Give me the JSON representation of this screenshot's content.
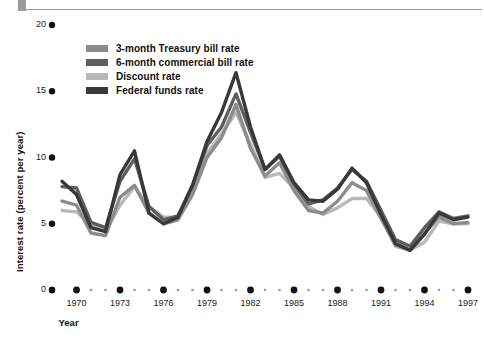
{
  "figure": {
    "rule_color": "#9a9a9a"
  },
  "axes": {
    "y_title": "Interest rate (percent per year)",
    "x_title": "Year",
    "y_ticks": [
      "0",
      "5",
      "10",
      "15",
      "20"
    ],
    "y_tick_values": [
      0,
      5,
      10,
      15,
      20
    ],
    "x_ticks": [
      "1970",
      "1973",
      "1976",
      "1979",
      "1982",
      "1985",
      "1988",
      "1991",
      "1994",
      "1997"
    ],
    "x_tick_values": [
      1970,
      1973,
      1976,
      1979,
      1982,
      1985,
      1988,
      1991,
      1994,
      1997
    ]
  },
  "legend": [
    {
      "label": "3-month Treasury bill rate",
      "color": "#8c8c8c"
    },
    {
      "label": "6-month commercial bill rate",
      "color": "#5e5e5e"
    },
    {
      "label": "Discount rate",
      "color": "#b9b9b9"
    },
    {
      "label": "Federal funds rate",
      "color": "#383838"
    }
  ],
  "chart_data": {
    "type": "line",
    "title": "",
    "xlabel": "Year",
    "ylabel": "Interest rate (percent per year)",
    "xlim": [
      1969,
      1997
    ],
    "ylim": [
      0,
      20
    ],
    "grid": false,
    "legend_position": "top-left-inside",
    "x": [
      1969,
      1970,
      1971,
      1972,
      1973,
      1974,
      1975,
      1976,
      1977,
      1978,
      1979,
      1980,
      1981,
      1982,
      1983,
      1984,
      1985,
      1986,
      1987,
      1988,
      1989,
      1990,
      1991,
      1992,
      1993,
      1994,
      1995,
      1996,
      1997
    ],
    "series": [
      {
        "name": "3-month Treasury bill rate",
        "color": "#8c8c8c",
        "values": [
          6.7,
          6.4,
          4.3,
          4.1,
          7.0,
          7.9,
          5.8,
          5.0,
          5.3,
          7.2,
          10.0,
          11.5,
          14.0,
          10.7,
          8.6,
          9.6,
          7.5,
          6.0,
          5.8,
          6.7,
          8.1,
          7.5,
          5.4,
          3.4,
          3.0,
          4.3,
          5.5,
          5.0,
          5.1
        ]
      },
      {
        "name": "6-month commercial bill rate",
        "color": "#5e5e5e",
        "values": [
          7.8,
          7.7,
          5.1,
          4.7,
          8.2,
          9.9,
          6.3,
          5.3,
          5.6,
          7.9,
          10.9,
          12.3,
          14.8,
          11.9,
          9.1,
          10.1,
          8.0,
          6.5,
          6.8,
          7.7,
          9.1,
          8.2,
          6.0,
          3.8,
          3.3,
          4.7,
          5.9,
          5.4,
          5.6
        ]
      },
      {
        "name": "Discount rate",
        "color": "#b9b9b9",
        "values": [
          6.0,
          5.9,
          4.9,
          4.4,
          6.4,
          7.8,
          6.3,
          5.5,
          5.5,
          7.5,
          10.3,
          11.8,
          13.4,
          11.0,
          8.5,
          8.8,
          7.7,
          6.3,
          5.7,
          6.2,
          6.9,
          6.9,
          5.5,
          3.3,
          3.0,
          3.6,
          5.2,
          5.0,
          5.0
        ]
      },
      {
        "name": "Federal funds rate",
        "color": "#383838",
        "values": [
          8.2,
          7.2,
          4.7,
          4.4,
          8.7,
          10.5,
          5.8,
          5.0,
          5.5,
          7.9,
          11.2,
          13.4,
          16.4,
          12.3,
          9.1,
          10.2,
          8.1,
          6.8,
          6.7,
          7.6,
          9.2,
          8.1,
          5.7,
          3.5,
          3.0,
          4.2,
          5.8,
          5.3,
          5.5
        ]
      }
    ]
  }
}
